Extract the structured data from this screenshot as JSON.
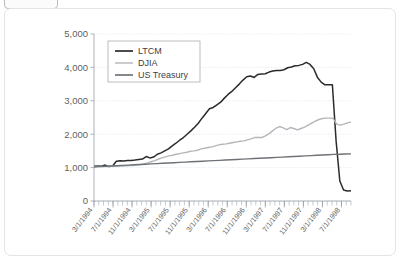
{
  "window": {
    "toolbar_button_label": ""
  },
  "chart_data": {
    "type": "line",
    "title": "",
    "subtitle": "",
    "xlabel": "",
    "ylabel": "",
    "grid": true,
    "legend_position": "top-left",
    "ylim": [
      0,
      5000
    ],
    "ytick_labels": [
      "0",
      "1,000",
      "2,000",
      "3,000",
      "4,000",
      "5,000"
    ],
    "ytick_values": [
      0,
      1000,
      2000,
      3000,
      4000,
      5000
    ],
    "xtick_labels": [
      "3/1/1994",
      "7/1/1994",
      "11/1/1994",
      "3/1/1995",
      "7/1/1995",
      "11/1/1995",
      "3/1/1996",
      "7/1/1996",
      "11/1/1996",
      "3/1/1997",
      "7/1/1997",
      "11/1/1997",
      "3/1/1998",
      "7/1/1998"
    ],
    "x_minor_tick_count": 54,
    "legend": [
      {
        "name": "LTCM",
        "color": "#2b2b2b"
      },
      {
        "name": "DJIA",
        "color": "#b4b7ba"
      },
      {
        "name": "US Treasury",
        "color": "#6e7276"
      }
    ],
    "series": [
      {
        "name": "LTCM",
        "color": "#2b2b2b",
        "width": 1.5,
        "values": [
          1050,
          1055,
          1042,
          1075,
          1030,
          1048,
          1190,
          1205,
          1200,
          1210,
          1215,
          1225,
          1240,
          1255,
          1330,
          1290,
          1315,
          1400,
          1440,
          1500,
          1560,
          1650,
          1730,
          1820,
          1900,
          2000,
          2100,
          2210,
          2330,
          2480,
          2620,
          2760,
          2800,
          2880,
          2960,
          3080,
          3190,
          3280,
          3390,
          3500,
          3620,
          3720,
          3740,
          3700,
          3790,
          3800,
          3810,
          3860,
          3890,
          3910,
          3910,
          3930,
          3990,
          4010,
          4050,
          4060,
          4090,
          4150,
          4090,
          3960,
          3700,
          3560,
          3480,
          3480,
          3480,
          1800,
          600,
          330,
          300,
          310
        ]
      },
      {
        "name": "DJIA",
        "color": "#b4b7ba",
        "width": 1.4,
        "values": [
          1040,
          1040,
          1035,
          1030,
          1035,
          1040,
          1045,
          1048,
          1050,
          1055,
          1060,
          1065,
          1075,
          1090,
          1110,
          1140,
          1175,
          1210,
          1250,
          1290,
          1320,
          1350,
          1370,
          1400,
          1420,
          1440,
          1460,
          1490,
          1500,
          1520,
          1560,
          1580,
          1600,
          1620,
          1650,
          1680,
          1700,
          1710,
          1730,
          1750,
          1770,
          1790,
          1800,
          1830,
          1860,
          1900,
          1900,
          1900,
          1950,
          2010,
          2100,
          2180,
          2230,
          2190,
          2140,
          2200,
          2170,
          2130,
          2170,
          2210,
          2270,
          2330,
          2390,
          2440,
          2470,
          2480,
          2480,
          2470,
          2300,
          2270,
          2300,
          2340,
          2360
        ]
      },
      {
        "name": "US Treasury",
        "color": "#6e7276",
        "width": 1.4,
        "values": [
          1020,
          1030,
          1040,
          1048,
          1057,
          1066,
          1075,
          1084,
          1093,
          1102,
          1111,
          1120,
          1128,
          1137,
          1146,
          1155,
          1164,
          1173,
          1182,
          1191,
          1200,
          1208,
          1217,
          1226,
          1235,
          1244,
          1253,
          1262,
          1271,
          1280,
          1288,
          1297,
          1306,
          1315,
          1324,
          1333,
          1342,
          1351,
          1360,
          1368,
          1377,
          1386,
          1395,
          1400,
          1405,
          1410
        ]
      }
    ]
  }
}
